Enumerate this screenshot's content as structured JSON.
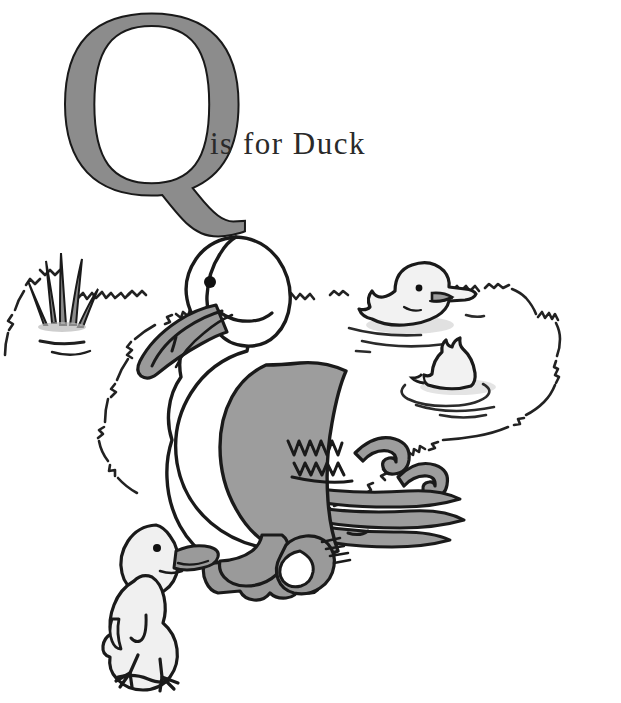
{
  "page": {
    "kind": "alphabet-book-illustration",
    "width": 621,
    "height": 703,
    "background_color": "#ffffff"
  },
  "headline": {
    "letter": "Q",
    "caption": "is for Duck",
    "full_text": "Q is for Duck",
    "letter_fill_color": "#8c8c8c",
    "letter_outline_color": "#191919",
    "caption_color": "#2a2a2a"
  },
  "illustration": {
    "title": "duck-with-ducklings-at-pond",
    "ink_color": "#1a1a1a",
    "palette": {
      "ink": "#1a1a1a",
      "white_body": "#ffffff",
      "wing_gray": "#9d9d9d",
      "bill_gray": "#9a9a9a",
      "foot_gray": "#9a9a9a",
      "duckling_body": "#f0f0f0",
      "reed_gray": "#8f8f8f",
      "water_line": "#3a3a3a",
      "shadow_gray": "#cfcfcf"
    },
    "subjects": [
      {
        "name": "mother-duck",
        "label": "Mother Duck",
        "pose": "standing, facing left",
        "body_fill": "#ffffff",
        "wing_fill": "#9d9d9d",
        "bill_fill": "#9a9a9a",
        "feet_fill": "#9a9a9a",
        "eye_color": "#111111"
      },
      {
        "name": "duckling-foreground",
        "label": "Duckling on bank",
        "pose": "standing, facing right",
        "body_fill": "#f0f0f0",
        "bill_fill": "#9a9a9a"
      },
      {
        "name": "duckling-swimming-upper",
        "label": "Duckling swimming",
        "pose": "floating, facing right",
        "body_fill": "#f0f0f0",
        "bill_fill": "#9a9a9a"
      },
      {
        "name": "duckling-swimming-lower",
        "label": "Duckling dabbling",
        "pose": "tail-up in water",
        "body_fill": "#f0f0f0",
        "bill_fill": "#9a9a9a"
      }
    ],
    "scenery": [
      {
        "name": "pond-outline",
        "label": "Pond edge",
        "style": "scribbled grass line"
      },
      {
        "name": "reeds",
        "label": "Reeds",
        "fill": "#8f8f8f"
      },
      {
        "name": "water-ripples",
        "label": "Water ripples",
        "count": 6
      }
    ]
  }
}
